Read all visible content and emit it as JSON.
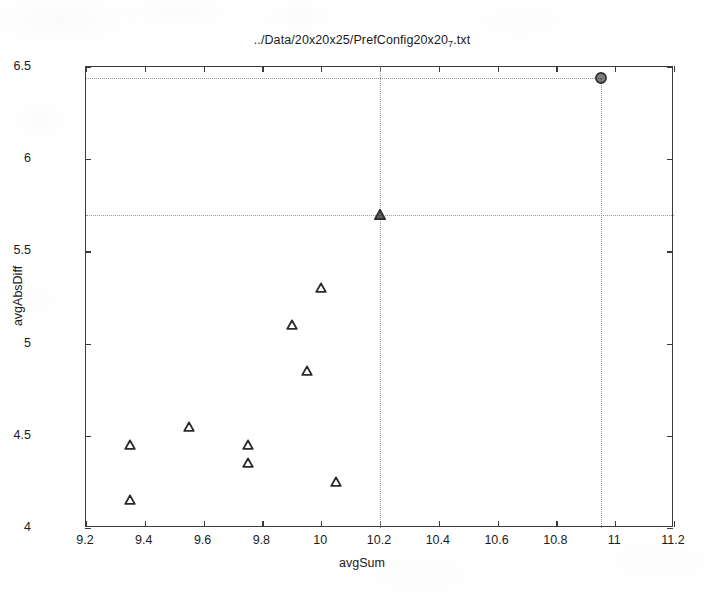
{
  "chart_data": {
    "type": "scatter",
    "title_main": "../Data/20x20x25/PrefConfig20x20",
    "title_sub": "7",
    "title_ext": ".txt",
    "xlabel": "avgSum",
    "ylabel": "avgAbsDiff",
    "xlim": [
      9.2,
      11.2
    ],
    "ylim": [
      4,
      6.5
    ],
    "xticks": [
      9.2,
      9.4,
      9.6,
      9.8,
      10,
      10.2,
      10.4,
      10.6,
      10.8,
      11,
      11.2
    ],
    "xticklabels": [
      "9.2",
      "9.4",
      "9.6",
      "9.8",
      "10",
      "10.2",
      "10.4",
      "10.6",
      "10.8",
      "11",
      "11.2"
    ],
    "yticks": [
      4,
      4.5,
      5,
      5.5,
      6,
      6.5
    ],
    "yticklabels": [
      "4",
      "4.5",
      "5",
      "5.5",
      "6",
      "6.5"
    ],
    "grid": false,
    "legend": null,
    "marker_color": "#2b2b2b",
    "reference_line_color": "#9a9a9a",
    "axis_color": "#3a3a3a",
    "series": [
      {
        "name": "configurations",
        "marker": "triangle-open",
        "points": [
          {
            "x": 9.35,
            "y": 4.45,
            "marker": "triangle-open"
          },
          {
            "x": 9.35,
            "y": 4.15,
            "marker": "triangle-open"
          },
          {
            "x": 9.55,
            "y": 4.55,
            "marker": "triangle-open"
          },
          {
            "x": 9.75,
            "y": 4.45,
            "marker": "triangle-open"
          },
          {
            "x": 9.75,
            "y": 4.35,
            "marker": "triangle-open"
          },
          {
            "x": 9.9,
            "y": 5.1,
            "marker": "triangle-open"
          },
          {
            "x": 9.95,
            "y": 4.85,
            "marker": "triangle-open"
          },
          {
            "x": 10.0,
            "y": 5.3,
            "marker": "triangle-open"
          },
          {
            "x": 10.05,
            "y": 4.25,
            "marker": "triangle-open"
          }
        ]
      },
      {
        "name": "highlighted",
        "marker": "triangle-filled",
        "points": [
          {
            "x": 10.2,
            "y": 5.7,
            "marker": "triangle-filled"
          },
          {
            "x": 10.95,
            "y": 6.44,
            "marker": "circle-filled"
          }
        ]
      }
    ],
    "reference_lines": [
      {
        "orientation": "horizontal",
        "value": 6.44,
        "from_x": 9.2,
        "to_x": 10.95,
        "style": "dotted"
      },
      {
        "orientation": "vertical",
        "value": 10.95,
        "from_y": 4.0,
        "to_y": 6.44,
        "style": "dotted"
      },
      {
        "orientation": "horizontal",
        "value": 5.7,
        "from_x": 9.2,
        "to_x": 11.2,
        "style": "dotted"
      },
      {
        "orientation": "vertical",
        "value": 10.2,
        "from_y": 4.0,
        "to_y": 6.5,
        "style": "dotted"
      }
    ]
  }
}
